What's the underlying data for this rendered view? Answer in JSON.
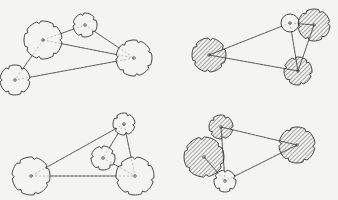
{
  "figure": {
    "width": 338,
    "height": 200,
    "background": "#f4f4f2",
    "stroke": "#333333",
    "hatch_color": "#444444",
    "panels": [
      {
        "id": "top-left",
        "nodes": [
          {
            "x": 43,
            "y": 40,
            "r": 19,
            "filled": false,
            "notches": 7
          },
          {
            "x": 85,
            "y": 25,
            "r": 12,
            "filled": false,
            "notches": 5
          },
          {
            "x": 134,
            "y": 58,
            "r": 18,
            "filled": false,
            "notches": 7
          },
          {
            "x": 15,
            "y": 80,
            "r": 15,
            "filled": false,
            "notches": 6
          }
        ],
        "edges": [
          [
            0,
            1
          ],
          [
            0,
            2
          ],
          [
            0,
            3
          ],
          [
            1,
            2
          ],
          [
            2,
            3
          ]
        ]
      },
      {
        "id": "top-right",
        "nodes": [
          {
            "x": 290,
            "y": 23,
            "r": 9,
            "filled": false,
            "notches": 0
          },
          {
            "x": 314,
            "y": 25,
            "r": 16,
            "filled": true,
            "notches": 6
          },
          {
            "x": 209,
            "y": 55,
            "r": 17,
            "filled": true,
            "notches": 6
          },
          {
            "x": 298,
            "y": 71,
            "r": 14,
            "filled": true,
            "notches": 6
          }
        ],
        "edges": [
          [
            0,
            1
          ],
          [
            0,
            2
          ],
          [
            0,
            3
          ],
          [
            1,
            3
          ],
          [
            2,
            3
          ]
        ]
      },
      {
        "id": "bottom-left",
        "nodes": [
          {
            "x": 124,
            "y": 124,
            "r": 11,
            "filled": false,
            "notches": 5
          },
          {
            "x": 103,
            "y": 158,
            "r": 12,
            "filled": false,
            "notches": 5
          },
          {
            "x": 31,
            "y": 176,
            "r": 19,
            "filled": false,
            "notches": 7
          },
          {
            "x": 135,
            "y": 176,
            "r": 19,
            "filled": false,
            "notches": 7
          }
        ],
        "edges": [
          [
            0,
            1
          ],
          [
            0,
            2
          ],
          [
            0,
            3
          ],
          [
            1,
            3
          ],
          [
            2,
            3
          ]
        ]
      },
      {
        "id": "bottom-right",
        "nodes": [
          {
            "x": 221,
            "y": 127,
            "r": 12,
            "filled": true,
            "notches": 5
          },
          {
            "x": 204,
            "y": 157,
            "r": 20,
            "filled": true,
            "notches": 6
          },
          {
            "x": 297,
            "y": 145,
            "r": 18,
            "filled": true,
            "notches": 6
          },
          {
            "x": 225,
            "y": 181,
            "r": 11,
            "filled": false,
            "notches": 5
          }
        ],
        "edges": [
          [
            0,
            2
          ],
          [
            0,
            3
          ],
          [
            1,
            3
          ],
          [
            2,
            3
          ]
        ]
      }
    ]
  }
}
